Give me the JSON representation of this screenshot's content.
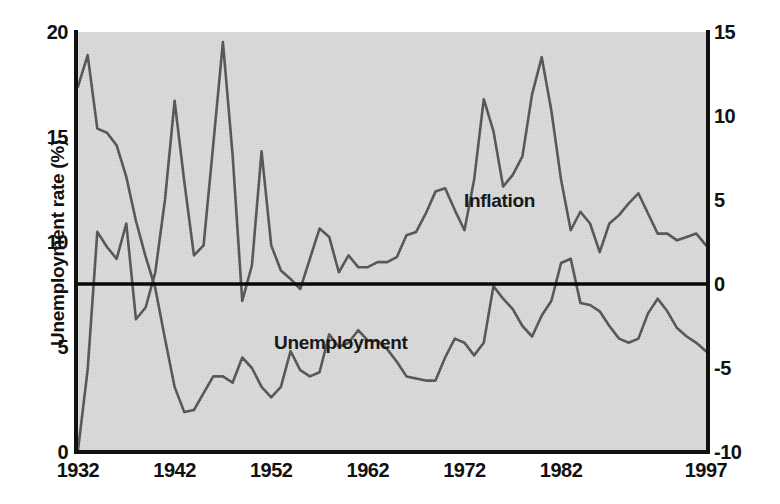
{
  "chart": {
    "left_axis_title": "Unemployment rate (%)",
    "right_axis_title": "Inflation rate (%)",
    "label_inflation": "Inflation",
    "label_unemployment": "Unemployment",
    "caption": ""
  },
  "colors": {
    "plot_background": "#dcdcdc",
    "line": "#555555",
    "axis": "#111111",
    "zero_line": "#000000",
    "page_background": "#ffffff"
  },
  "chart_data": {
    "type": "line",
    "title": "",
    "xlabel": "",
    "grid": false,
    "legend": "in-plot annotations",
    "x_ticks": [
      1932,
      1942,
      1952,
      1962,
      1972,
      1982,
      1997
    ],
    "x_tick_labels": [
      "1932",
      "1942",
      "1952",
      "1962",
      "1972",
      "1982",
      "1997"
    ],
    "xlim": [
      1932,
      1997
    ],
    "left_axis": {
      "label": "Unemployment rate (%)",
      "ylim": [
        0,
        20
      ],
      "ticks": [
        0,
        5,
        10,
        15,
        20
      ],
      "tick_labels": [
        "0",
        "5",
        "10",
        "15",
        "20"
      ]
    },
    "right_axis": {
      "label": "Inflation rate (%)",
      "ylim": [
        -10,
        15
      ],
      "ticks": [
        -10,
        -5,
        0,
        5,
        10,
        15
      ],
      "tick_labels": [
        "-10",
        "-5",
        "0",
        "5",
        "10",
        "15"
      ]
    },
    "zero_reference_line": 0,
    "x": [
      1932,
      1933,
      1934,
      1935,
      1936,
      1937,
      1938,
      1939,
      1940,
      1941,
      1942,
      1943,
      1944,
      1945,
      1946,
      1947,
      1948,
      1949,
      1950,
      1951,
      1952,
      1953,
      1954,
      1955,
      1956,
      1957,
      1958,
      1959,
      1960,
      1961,
      1962,
      1963,
      1964,
      1965,
      1966,
      1967,
      1968,
      1969,
      1970,
      1971,
      1972,
      1973,
      1974,
      1975,
      1976,
      1977,
      1978,
      1979,
      1980,
      1981,
      1982,
      1983,
      1984,
      1985,
      1986,
      1987,
      1988,
      1989,
      1990,
      1991,
      1992,
      1993,
      1994,
      1995,
      1996,
      1997
    ],
    "series": [
      {
        "name": "Unemployment",
        "axis": "left",
        "units": "percent",
        "values": [
          17.4,
          18.9,
          15.4,
          15.2,
          14.6,
          13.1,
          11.0,
          9.3,
          7.8,
          5.4,
          3.1,
          1.9,
          2.0,
          2.8,
          3.6,
          3.6,
          3.3,
          4.5,
          4.0,
          3.1,
          2.6,
          3.1,
          4.8,
          3.9,
          3.6,
          3.8,
          5.6,
          5.0,
          5.2,
          5.8,
          5.3,
          5.3,
          4.9,
          4.3,
          3.6,
          3.5,
          3.4,
          3.4,
          4.5,
          5.4,
          5.2,
          4.6,
          5.2,
          7.9,
          7.3,
          6.8,
          6.0,
          5.5,
          6.5,
          7.2,
          9.0,
          9.2,
          7.1,
          7.0,
          6.7,
          6.0,
          5.4,
          5.2,
          5.4,
          6.6,
          7.3,
          6.7,
          5.9,
          5.5,
          5.2,
          4.8
        ]
      },
      {
        "name": "Inflation",
        "axis": "right",
        "units": "percent",
        "values": [
          -9.9,
          -5.1,
          3.1,
          2.2,
          1.5,
          3.6,
          -2.1,
          -1.4,
          0.7,
          5.0,
          10.9,
          6.1,
          1.7,
          2.3,
          8.3,
          14.4,
          7.7,
          -1.0,
          1.1,
          7.9,
          2.3,
          0.8,
          0.3,
          -0.3,
          1.5,
          3.3,
          2.8,
          0.7,
          1.7,
          1.0,
          1.0,
          1.3,
          1.3,
          1.6,
          2.9,
          3.1,
          4.2,
          5.5,
          5.7,
          4.4,
          3.2,
          6.2,
          11.0,
          9.1,
          5.8,
          6.5,
          7.6,
          11.3,
          13.5,
          10.3,
          6.2,
          3.2,
          4.3,
          3.6,
          1.9,
          3.6,
          4.1,
          4.8,
          5.4,
          4.2,
          3.0,
          3.0,
          2.6,
          2.8,
          3.0,
          2.3
        ]
      }
    ]
  }
}
